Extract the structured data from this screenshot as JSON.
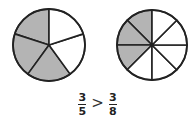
{
  "colors": {
    "shaded": "#b4b4b4",
    "unshaded": "#ffffff",
    "stroke": "#222222"
  },
  "pies": [
    {
      "name": "fifths",
      "parts": 5,
      "shaded": 3,
      "cx": 49,
      "cy": 45,
      "r": 36
    },
    {
      "name": "eighths",
      "parts": 8,
      "shaded": 3,
      "cx": 152,
      "cy": 45,
      "r": 35
    }
  ],
  "comparison": {
    "left": {
      "numerator": "3",
      "denominator": "5"
    },
    "operator": ">",
    "right": {
      "numerator": "3",
      "denominator": "8"
    }
  }
}
